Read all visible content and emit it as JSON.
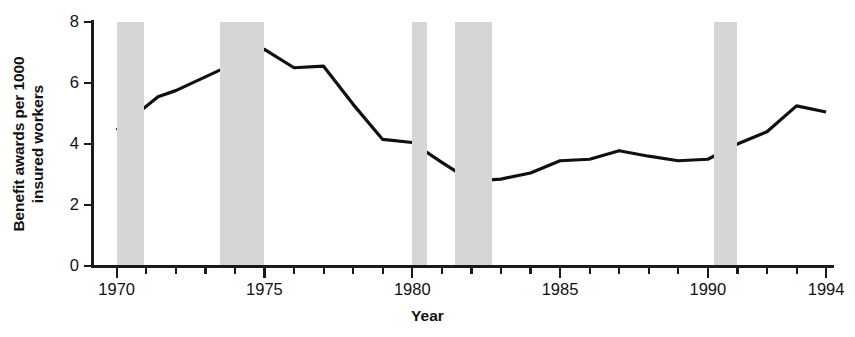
{
  "chart_data": {
    "type": "line",
    "title": "",
    "xlabel": "Year",
    "ylabel": "Benefit awards per 1000\ninsured workers",
    "ylabel_lines": [
      "Benefit awards per 1000",
      "insured workers"
    ],
    "xlim": [
      1969.2,
      1994.2
    ],
    "ylim": [
      0,
      8
    ],
    "grid": false,
    "legend": null,
    "y_ticks": [
      0,
      2,
      4,
      6,
      8
    ],
    "y_tick_labels": [
      "0",
      "2",
      "4",
      "6",
      "8"
    ],
    "x_major_ticks": [
      1970,
      1975,
      1980,
      1985,
      1990,
      1994
    ],
    "x_major_tick_labels": [
      "1970",
      "1975",
      "1980",
      "1985",
      "1990",
      "1994"
    ],
    "x_minor_tick_interval": 1,
    "line_color": "#101010",
    "line_width": 3.2,
    "band_color": "#d6d6d6",
    "x": [
      1970,
      1971.4,
      1972,
      1973,
      1974,
      1975,
      1976,
      1977,
      1978,
      1979,
      1980,
      1981,
      1982,
      1983,
      1984,
      1985,
      1986,
      1987,
      1988,
      1989,
      1990,
      1991,
      1992,
      1993,
      1994
    ],
    "values": [
      4.45,
      5.55,
      5.75,
      6.2,
      6.65,
      7.1,
      6.5,
      6.55,
      5.3,
      4.15,
      4.05,
      3.4,
      2.78,
      2.85,
      3.05,
      3.45,
      3.5,
      3.78,
      3.6,
      3.45,
      3.5,
      4.0,
      4.4,
      5.25,
      5.05
    ],
    "series": [
      {
        "name": "Benefit awards per 1000 insured workers",
        "values": [
          4.45,
          5.55,
          5.75,
          6.2,
          6.65,
          7.1,
          6.5,
          6.55,
          5.3,
          4.15,
          4.05,
          3.4,
          2.78,
          2.85,
          3.05,
          3.45,
          3.5,
          3.78,
          3.6,
          3.45,
          3.5,
          4.0,
          4.4,
          5.25,
          5.05
        ]
      }
    ],
    "shaded_bands": [
      {
        "label": "recession-1970",
        "start": 1970.0,
        "end": 1970.92
      },
      {
        "label": "recession-1973-75",
        "start": 1973.5,
        "end": 1975.0
      },
      {
        "label": "recession-1980",
        "start": 1980.0,
        "end": 1980.5
      },
      {
        "label": "recession-1981-82",
        "start": 1981.45,
        "end": 1982.7
      },
      {
        "label": "recession-1990-91",
        "start": 1990.2,
        "end": 1991.0
      }
    ]
  }
}
